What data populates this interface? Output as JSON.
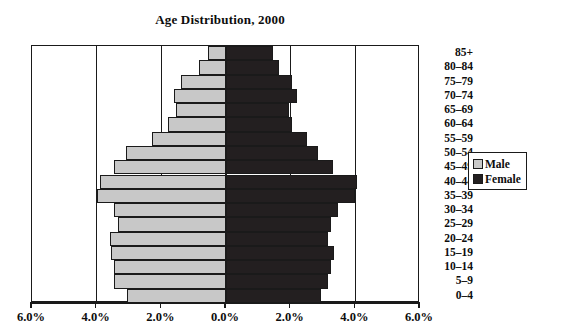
{
  "chart_data": {
    "type": "bar",
    "subtype": "population-pyramid",
    "title": "Age Distribution, 2000",
    "xlabel": "",
    "ylabel": "",
    "grid": true,
    "legend_position": "right",
    "axis": {
      "xlim": [
        -6.0,
        6.0
      ],
      "xticks": [
        -6.0,
        -4.0,
        -2.0,
        0.0,
        2.0,
        4.0,
        6.0
      ],
      "xtick_labels": [
        "6.0%",
        "4.0%",
        "2.0%",
        "0.0%",
        "2.0%",
        "4.0%",
        "6.0%"
      ],
      "units": "percent"
    },
    "categories": [
      "85+",
      "80–84",
      "75–79",
      "70–74",
      "65–69",
      "60–64",
      "55–59",
      "50–54",
      "45–49",
      "40–44",
      "35–39",
      "30–34",
      "25–29",
      "20–24",
      "15–19",
      "10–14",
      "5–9",
      "0–4"
    ],
    "series": [
      {
        "name": "Male",
        "color": "#c8c8c8",
        "direction": "left",
        "values": [
          0.55,
          0.85,
          1.4,
          1.6,
          1.55,
          1.8,
          2.3,
          3.1,
          3.45,
          3.9,
          4.0,
          3.45,
          3.35,
          3.6,
          3.55,
          3.45,
          3.45,
          3.05
        ]
      },
      {
        "name": "Female",
        "color": "#231f20",
        "direction": "right",
        "values": [
          1.45,
          1.65,
          2.05,
          2.2,
          1.95,
          2.05,
          2.5,
          2.85,
          3.3,
          4.05,
          4.0,
          3.45,
          3.25,
          3.15,
          3.35,
          3.25,
          3.15,
          2.95
        ]
      }
    ]
  },
  "legend": {
    "items": [
      {
        "label": "Male",
        "swatch": "male"
      },
      {
        "label": "Female",
        "swatch": "female"
      }
    ]
  }
}
